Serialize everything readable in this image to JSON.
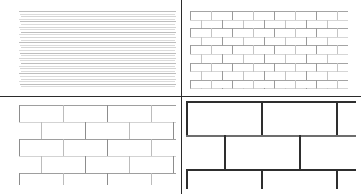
{
  "figure": {
    "width": 361,
    "height": 194,
    "background_color": "#ffffff",
    "layout": "2x2 grid of panels separated by thin dark rules",
    "divider_color": "#2b2b2b"
  },
  "dividers": {
    "vertical": {
      "x": 181,
      "y": 0,
      "height": 194,
      "thickness": 1,
      "color": "#2b2b2b"
    },
    "horizontal": {
      "x": 0,
      "y": 96,
      "width": 361,
      "thickness": 1,
      "color": "#2b2b2b"
    }
  },
  "panels": [
    {
      "id": "top-left",
      "name": "finest-scale-panel",
      "position": {
        "x": 0,
        "y": 0,
        "width": 181,
        "height": 96
      },
      "content_box": {
        "x": 19,
        "y": 11,
        "width": 157,
        "height": 78
      },
      "pattern": "horizontal-striations",
      "description": "Running-bond brick wall rendered so small that only the horizontal bed joints resolve; head joints are below the sampling limit and the field reads as fine grey horizontal lines.",
      "brick_width": 6.5,
      "brick_height": 2.6,
      "course_count": 30,
      "bed_joint_thickness": 1,
      "head_joint_thickness": 0,
      "line_color": "#b9b9b9",
      "line_color_alt": "#d2d2d2",
      "offset_pattern": "half-bond"
    },
    {
      "id": "top-right",
      "name": "fine-scale-panel",
      "position": {
        "x": 182,
        "y": 0,
        "width": 179,
        "height": 96
      },
      "content_box": {
        "x": 8,
        "y": 11,
        "width": 158,
        "height": 78
      },
      "pattern": "running-bond-brick",
      "description": "Running-bond brick wall at fine scale; individual bricks are just resolvable with thin grey mortar joints.",
      "brick_width": 21,
      "brick_height": 8.6,
      "course_count": 9,
      "bricks_per_course": 8,
      "bed_joint_thickness": 1,
      "head_joint_thickness": 1,
      "line_color": "#9a9a9a",
      "line_color_alt": "#c4c4c4",
      "offset_pattern": "half-bond"
    },
    {
      "id": "bottom-left",
      "name": "medium-scale-panel",
      "position": {
        "x": 0,
        "y": 97,
        "width": 181,
        "height": 97
      },
      "content_box": {
        "x": 19,
        "y": 8,
        "width": 157,
        "height": 80
      },
      "pattern": "running-bond-brick",
      "description": "Running-bond brick wall at medium scale; bricks roughly twice the linear size of the fine-scale panel, joints rendered as light grey lines with soft shading.",
      "brick_width": 44,
      "brick_height": 17,
      "course_count": 5,
      "bricks_per_course": 4,
      "bed_joint_thickness": 1,
      "head_joint_thickness": 1,
      "line_color": "#8d8d8d",
      "line_color_alt": "#bcbcbc",
      "offset_pattern": "half-bond"
    },
    {
      "id": "bottom-right",
      "name": "coarse-scale-panel",
      "position": {
        "x": 182,
        "y": 97,
        "width": 179,
        "height": 97
      },
      "content_box": {
        "x": 4,
        "y": 4,
        "width": 170,
        "height": 88
      },
      "pattern": "running-bond-brick",
      "description": "Running-bond brick wall at coarse scale; only a few very large bricks fill the frame and the mortar joints are rendered as thick dark bars.",
      "brick_width": 75,
      "brick_height": 34,
      "course_count": 3,
      "bricks_per_course": 2,
      "bed_joint_thickness": 2,
      "head_joint_thickness": 2,
      "line_color": "#2e2e2e",
      "line_color_alt": "#6d6d6d",
      "offset_pattern": "half-bond"
    }
  ],
  "chart_data": {
    "type": "heatmap",
    "xlabel": "",
    "ylabel": "",
    "categories": [
      "finest",
      "fine",
      "medium",
      "coarse"
    ],
    "series": [
      {
        "name": "brick_width_px",
        "values": [
          6.5,
          21,
          44,
          75
        ]
      },
      {
        "name": "brick_height_px",
        "values": [
          2.6,
          8.6,
          17,
          34
        ]
      },
      {
        "name": "courses_visible",
        "values": [
          30,
          9,
          5,
          3
        ]
      },
      {
        "name": "joint_thickness_px",
        "values": [
          1,
          1,
          1,
          2
        ]
      }
    ],
    "legend_position": "none",
    "grid": false
  }
}
